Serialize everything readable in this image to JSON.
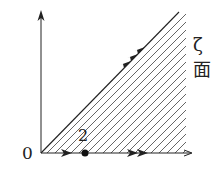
{
  "diagram": {
    "plane_label": "ζ 面",
    "origin_label": "0",
    "point_label": "2",
    "colors": {
      "ink": "#222222",
      "hatch": "#555555",
      "background": "#ffffff"
    },
    "elements": [
      {
        "type": "axis",
        "direction": "vertical",
        "arrow": "single"
      },
      {
        "type": "axis",
        "direction": "horizontal",
        "arrow": "single"
      },
      {
        "type": "boundary-ray",
        "from": "origin",
        "angle_deg": 45,
        "arrow": "triple"
      },
      {
        "type": "boundary-segment",
        "from": "0",
        "to": "2",
        "arrow": "single"
      },
      {
        "type": "boundary-ray",
        "from": "2",
        "to": "+inf",
        "arrow": "double"
      },
      {
        "type": "point",
        "at": "2",
        "style": "filled"
      },
      {
        "type": "hatched-region",
        "between": "ray at 45° and positive real axis"
      }
    ]
  }
}
